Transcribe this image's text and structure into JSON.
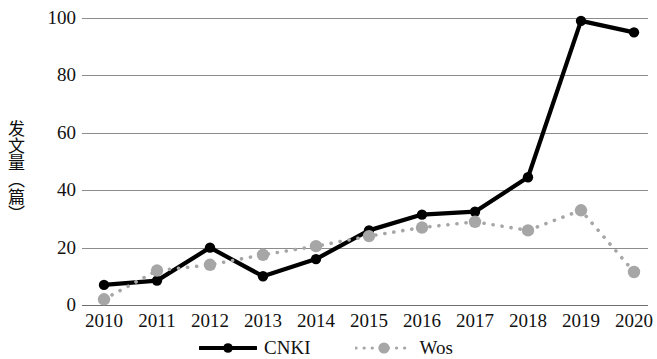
{
  "chart_data": {
    "type": "line",
    "title": "",
    "xlabel": "",
    "ylabel": "发文量（篇）",
    "categories": [
      "2010",
      "2011",
      "2012",
      "2013",
      "2014",
      "2015",
      "2016",
      "2017",
      "2018",
      "2019",
      "2020"
    ],
    "series": [
      {
        "name": "CNKI",
        "color": "#000000",
        "style": "solid",
        "marker": "circle",
        "values": [
          7,
          8.5,
          20,
          10,
          16,
          26,
          31.5,
          32.5,
          44.5,
          99,
          95
        ]
      },
      {
        "name": "Wos",
        "color": "#a6a6a6",
        "style": "dotted",
        "marker": "circle",
        "values": [
          2,
          12,
          14,
          17.5,
          20.5,
          24,
          27,
          29,
          26,
          33,
          11.5
        ]
      }
    ],
    "ylim": [
      0,
      100
    ],
    "yticks": [
      0,
      20,
      40,
      60,
      80,
      100
    ],
    "ytick_labels": [
      "0",
      "20",
      "40",
      "60",
      "80",
      "100"
    ],
    "grid": true,
    "grid_axis": "y",
    "legend_position": "bottom"
  },
  "legend": {
    "entries": [
      {
        "label": "CNKI"
      },
      {
        "label": "Wos"
      }
    ]
  },
  "axes": {
    "y_title": "发文量（篇）"
  }
}
